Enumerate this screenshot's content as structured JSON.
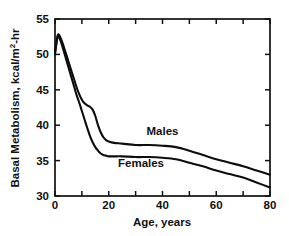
{
  "chart_data": {
    "type": "line",
    "title": "",
    "subtitle": "",
    "xlabel": "Age, years",
    "ylabel": "Basal  Metabolism, kcal/m2-hr",
    "ylabel_parts": {
      "prefix": "Basal  Metabolism, kcal/m",
      "superscript": "2",
      "suffix": "-hr"
    },
    "xlim": [
      0,
      80
    ],
    "ylim": [
      30,
      55
    ],
    "x_ticks_major": [
      0,
      20,
      40,
      60,
      80
    ],
    "x_ticks_minor": [
      10,
      30,
      50,
      70
    ],
    "x_tick_labels": [
      "0",
      "20",
      "40",
      "60",
      "80"
    ],
    "y_ticks_major": [
      30,
      35,
      40,
      45,
      50,
      55
    ],
    "y_tick_labels": [
      "30",
      "35",
      "40",
      "45",
      "50",
      "55"
    ],
    "grid": false,
    "legend_position": "inline-annotations",
    "line_color": "#0d0d0d",
    "series": [
      {
        "name": "Males",
        "label": "Males",
        "label_x": 40,
        "label_y": 38.6,
        "x": [
          0,
          1,
          2,
          3,
          5,
          7,
          8,
          9,
          10,
          11,
          12,
          13,
          14,
          15,
          16,
          17,
          18,
          19,
          20,
          22,
          25,
          30,
          35,
          40,
          45,
          50,
          55,
          60,
          65,
          70,
          75,
          80
        ],
        "values": [
          50.3,
          52.7,
          52.4,
          51.4,
          49.0,
          46.6,
          45.4,
          44.4,
          43.6,
          43.1,
          42.8,
          42.6,
          42.2,
          41.3,
          40.0,
          39.0,
          38.3,
          37.9,
          37.7,
          37.5,
          37.4,
          37.2,
          37.2,
          37.1,
          36.9,
          36.4,
          35.8,
          35.2,
          34.7,
          34.2,
          33.6,
          33.0
        ]
      },
      {
        "name": "Females",
        "label": "Females",
        "label_x": 32,
        "label_y": 34.1,
        "x": [
          0,
          1,
          2,
          3,
          5,
          7,
          8,
          9,
          10,
          11,
          12,
          13,
          14,
          15,
          16,
          17,
          18,
          19,
          20,
          22,
          25,
          30,
          35,
          40,
          45,
          50,
          55,
          60,
          65,
          70,
          75,
          80
        ],
        "values": [
          50.0,
          52.5,
          52.0,
          50.8,
          48.2,
          45.6,
          44.3,
          43.2,
          42.0,
          40.8,
          39.6,
          38.5,
          37.6,
          36.9,
          36.4,
          36.0,
          35.8,
          35.7,
          35.6,
          35.6,
          35.6,
          35.5,
          35.5,
          35.4,
          35.2,
          34.7,
          34.2,
          33.6,
          33.1,
          32.6,
          31.9,
          31.2
        ]
      }
    ]
  },
  "plot_geometry": {
    "left": 55,
    "right": 270,
    "top": 19,
    "bottom": 196
  }
}
